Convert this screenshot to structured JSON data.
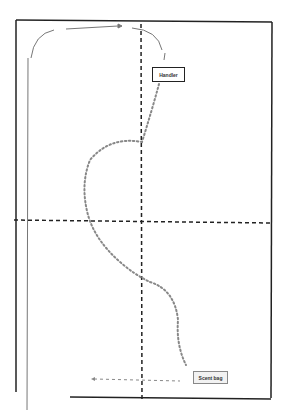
{
  "diagram": {
    "type": "path-diagram",
    "labels": {
      "top_box": "Handler",
      "bottom_box": "Scent bag"
    },
    "colors": {
      "frame": "#222222",
      "axis_dashes": "#222222",
      "dotted_path": "#888888",
      "arrows": "#777777"
    }
  }
}
